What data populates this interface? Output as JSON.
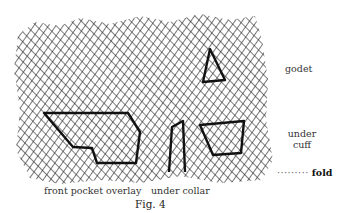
{
  "figure": {
    "caption": "Fig. 4",
    "labels": {
      "godet": "godet",
      "under_cuff_line1": "under",
      "under_cuff_line2": "cuff",
      "front_pocket_overlay": "front pocket overlay",
      "under_collar": "under collar",
      "fold_marker": "·········",
      "fold": "fold"
    },
    "colors": {
      "hatch": "#2a2a2a",
      "outline": "#111111",
      "background": "#ffffff"
    },
    "fabric_region": {
      "x": 16,
      "y": 18,
      "width": 257,
      "height": 165
    },
    "pattern_pieces": [
      {
        "name": "godet",
        "points": "210,49 203,82 225,80"
      },
      {
        "name": "front pocket overlay",
        "points": "44,113 128,113 140,132 136,163 97,163 92,148 73,147"
      },
      {
        "name": "under collar",
        "points": "169,172 172,127 183,121 185,172"
      },
      {
        "name": "under cuff",
        "points": "200,125 244,121 241,153 213,155"
      }
    ]
  }
}
